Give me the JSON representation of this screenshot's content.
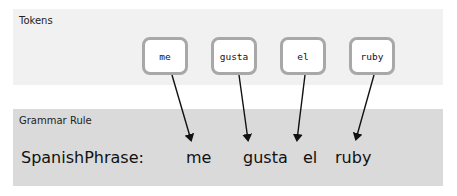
{
  "tokens_panel": {
    "label": "Tokens",
    "tokens": [
      "me",
      "gusta",
      "el",
      "ruby"
    ]
  },
  "grammar_panel": {
    "label": "Grammar Rule",
    "rule_name": "SpanishPhrase:",
    "words": [
      "me",
      "gusta",
      "el",
      "ruby"
    ]
  },
  "colors": {
    "tokens_bg": "#f1f1f1",
    "grammar_bg": "#dadada",
    "token_border": "#a8a8a8",
    "arrow": "#111111"
  }
}
